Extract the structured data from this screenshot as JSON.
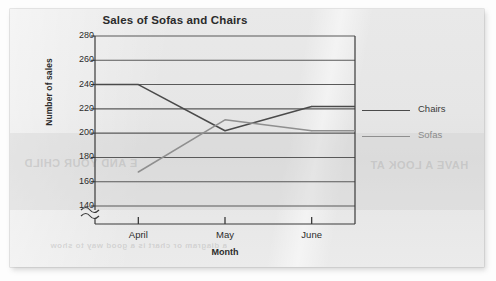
{
  "page": {
    "ghost_text_left": "E AND YOUR CHILD",
    "ghost_text_right": "HAVE A LOOK AT",
    "ghost_text_bottom": "a diagram or chart is a good way to show"
  },
  "chart_data": {
    "type": "line",
    "title": "Sales of Sofas and Chairs",
    "xlabel": "Month",
    "ylabel": "Number of sales",
    "categories": [
      "April",
      "May",
      "June"
    ],
    "series": [
      {
        "name": "Chairs",
        "values": [
          240,
          202,
          222
        ],
        "color": "#4a4a4a"
      },
      {
        "name": "Sofas",
        "values": [
          168,
          211,
          202
        ],
        "color": "#8f8f8f"
      }
    ],
    "yticks": [
      140,
      160,
      180,
      200,
      220,
      240,
      260,
      280
    ],
    "ylim": [
      140,
      280
    ],
    "grid": true,
    "axis_break": true,
    "axis_break_symbol": "≈",
    "legend_position": "right",
    "legend": [
      {
        "label": "Chairs",
        "color": "#4a4a4a"
      },
      {
        "label": "Sofas",
        "color": "#8f8f8f"
      }
    ]
  }
}
